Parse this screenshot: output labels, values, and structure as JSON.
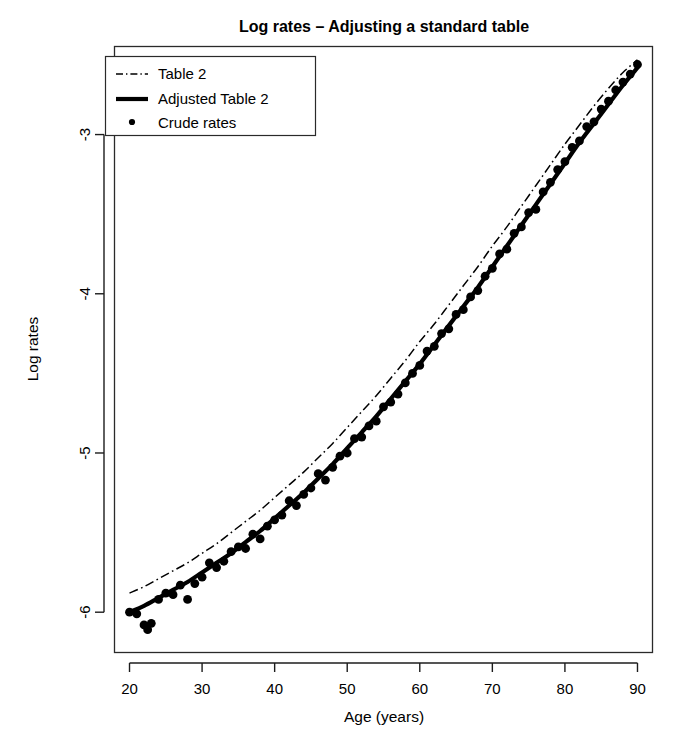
{
  "figure": {
    "width": 685,
    "height": 740,
    "background": "#ffffff",
    "ink_color": "#000000"
  },
  "artifact": {
    "name": "page-edge-mark",
    "description": "black scan mark at top-left"
  },
  "chart_data": {
    "type": "line",
    "title": "Log rates – Adjusting a standard table",
    "xlabel": "Age (years)",
    "ylabel": "Log rates",
    "xlim": [
      18,
      92
    ],
    "ylim": [
      -6.25,
      -2.45
    ],
    "xticks": [
      20,
      30,
      40,
      50,
      60,
      70,
      80,
      90
    ],
    "xticklabels": [
      "20",
      "30",
      "40",
      "50",
      "60",
      "70",
      "80",
      "90"
    ],
    "yticks": [
      -3,
      -4,
      -5,
      -6
    ],
    "yticklabels": [
      "-3",
      "-4",
      "-5",
      "-6"
    ],
    "grid": false,
    "legend_position": "top-left",
    "series": [
      {
        "name": "Table 2",
        "style": "dash-dot",
        "color": "#000000",
        "x": [
          20,
          22,
          24,
          26,
          28,
          30,
          32,
          34,
          36,
          38,
          40,
          42,
          44,
          46,
          48,
          50,
          52,
          54,
          56,
          58,
          60,
          62,
          64,
          66,
          68,
          70,
          72,
          74,
          76,
          78,
          80,
          82,
          84,
          86,
          88,
          90
        ],
        "y": [
          -5.88,
          -5.84,
          -5.79,
          -5.74,
          -5.69,
          -5.63,
          -5.57,
          -5.5,
          -5.43,
          -5.36,
          -5.28,
          -5.2,
          -5.12,
          -5.03,
          -4.94,
          -4.84,
          -4.74,
          -4.64,
          -4.53,
          -4.42,
          -4.3,
          -4.19,
          -4.07,
          -3.95,
          -3.83,
          -3.7,
          -3.58,
          -3.45,
          -3.32,
          -3.19,
          -3.06,
          -2.94,
          -2.82,
          -2.71,
          -2.61,
          -2.53
        ]
      },
      {
        "name": "Adjusted Table 2",
        "style": "solid-thick",
        "color": "#000000",
        "x": [
          20,
          22,
          24,
          26,
          28,
          30,
          32,
          34,
          36,
          38,
          40,
          42,
          44,
          46,
          48,
          50,
          52,
          54,
          56,
          58,
          60,
          62,
          64,
          66,
          68,
          70,
          72,
          74,
          76,
          78,
          80,
          82,
          84,
          86,
          88,
          90
        ],
        "y": [
          -6.0,
          -5.96,
          -5.91,
          -5.86,
          -5.81,
          -5.75,
          -5.69,
          -5.63,
          -5.56,
          -5.49,
          -5.41,
          -5.33,
          -5.25,
          -5.16,
          -5.07,
          -4.97,
          -4.87,
          -4.77,
          -4.66,
          -4.55,
          -4.44,
          -4.32,
          -4.2,
          -4.08,
          -3.96,
          -3.83,
          -3.7,
          -3.57,
          -3.44,
          -3.31,
          -3.18,
          -3.05,
          -2.93,
          -2.81,
          -2.69,
          -2.58
        ]
      }
    ],
    "points": {
      "name": "Crude rates",
      "style": "filled-circle",
      "color": "#000000",
      "x": [
        20,
        21,
        22,
        22.5,
        23,
        24,
        25,
        26,
        27,
        28,
        29,
        30,
        31,
        32,
        33,
        34,
        35,
        36,
        37,
        38,
        39,
        40,
        41,
        42,
        43,
        44,
        45,
        46,
        47,
        48,
        49,
        50,
        51,
        52,
        53,
        54,
        55,
        56,
        57,
        58,
        59,
        60,
        61,
        62,
        63,
        64,
        65,
        66,
        67,
        68,
        69,
        70,
        71,
        72,
        73,
        74,
        75,
        76,
        77,
        78,
        79,
        80,
        81,
        82,
        83,
        84,
        85,
        86,
        87,
        88,
        89,
        90
      ],
      "y": [
        -6.0,
        -6.01,
        -6.08,
        -6.11,
        -6.07,
        -5.92,
        -5.88,
        -5.89,
        -5.83,
        -5.92,
        -5.82,
        -5.78,
        -5.69,
        -5.72,
        -5.68,
        -5.62,
        -5.59,
        -5.6,
        -5.51,
        -5.54,
        -5.46,
        -5.42,
        -5.39,
        -5.3,
        -5.33,
        -5.26,
        -5.22,
        -5.13,
        -5.17,
        -5.09,
        -5.02,
        -5.0,
        -4.91,
        -4.9,
        -4.83,
        -4.8,
        -4.71,
        -4.68,
        -4.63,
        -4.56,
        -4.5,
        -4.45,
        -4.36,
        -4.33,
        -4.25,
        -4.22,
        -4.13,
        -4.1,
        -4.02,
        -3.98,
        -3.89,
        -3.84,
        -3.75,
        -3.72,
        -3.62,
        -3.58,
        -3.49,
        -3.47,
        -3.36,
        -3.3,
        -3.22,
        -3.17,
        -3.08,
        -3.04,
        -2.95,
        -2.92,
        -2.84,
        -2.79,
        -2.72,
        -2.67,
        -2.62,
        -2.56
      ]
    },
    "legend": [
      {
        "label": "Table 2",
        "key": "dash-dot-line"
      },
      {
        "label": "Adjusted Table 2",
        "key": "solid-thick-line"
      },
      {
        "label": "Crude rates",
        "key": "dot-marker"
      }
    ]
  }
}
